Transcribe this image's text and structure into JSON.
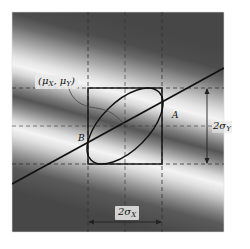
{
  "figure": {
    "labels": {
      "mean": "(μX, μY)",
      "mean_mu": "μ",
      "mean_x_sub": "X",
      "mean_y_sub": "Y",
      "point_a": "A",
      "point_b": "B",
      "height": "2σY",
      "height_main": "2σ",
      "height_sub": "Y",
      "width": "2σX",
      "width_main": "2σ",
      "width_sub": "X"
    },
    "colors": {
      "dark_band": "#4a4a4a",
      "light_band": "#f2f2f2",
      "line": "#111111",
      "dashed": "#333333",
      "background": "#ffffff"
    }
  }
}
